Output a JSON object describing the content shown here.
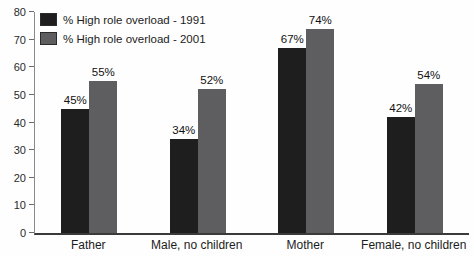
{
  "chart_data": {
    "type": "bar",
    "categories": [
      "Father",
      "Male, no children",
      "Mother",
      "Female, no children"
    ],
    "series": [
      {
        "name": "% High role overload - 1991",
        "color": "#1e1e1e",
        "values": [
          45,
          34,
          67,
          42
        ],
        "labels": [
          "45%",
          "34%",
          "67%",
          "42%"
        ]
      },
      {
        "name": "% High role overload - 2001",
        "color": "#5e5e60",
        "values": [
          55,
          52,
          74,
          54
        ],
        "labels": [
          "55%",
          "52%",
          "74%",
          "54%"
        ]
      }
    ],
    "title": "",
    "xlabel": "",
    "ylabel": "",
    "ylim": [
      0,
      80
    ],
    "ytick_step": 10,
    "yticks": [
      0,
      10,
      20,
      30,
      40,
      50,
      60,
      70,
      80
    ],
    "grid": false,
    "legend_position": "top-left"
  }
}
